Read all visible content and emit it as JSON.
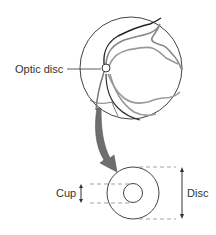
{
  "diagram": {
    "labels": {
      "optic_disc": "Optic disc",
      "cup": "Cup",
      "disc": "Disc"
    },
    "elements": {
      "fundus": "retinal fundus with vessels",
      "pointer_arrow": "curved arrow from optic disc to enlarged view",
      "enlarged_disc": "disc circle with concentric cup circle"
    },
    "colors": {
      "stroke": "#333333",
      "vessel_light": "#9a9a9a",
      "arrow_fill": "#6e6e6e",
      "dash": "#8a8a8a"
    }
  }
}
